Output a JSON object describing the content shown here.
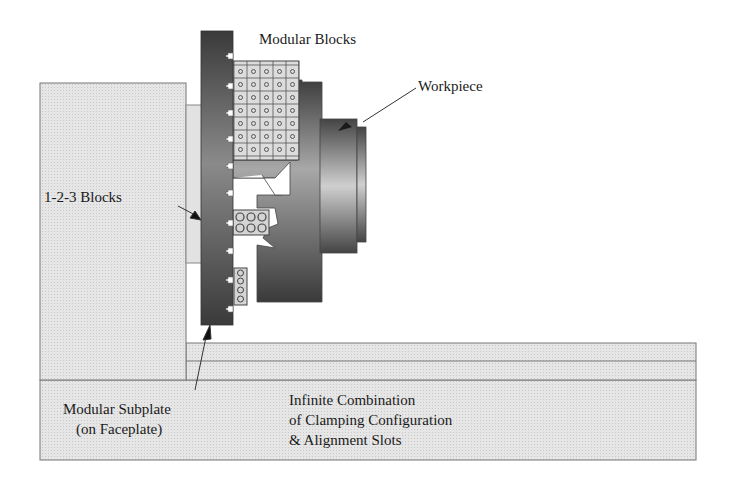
{
  "diagram": {
    "type": "lathe-faceplate-fixturing-illustration",
    "labels": {
      "modular_blocks": "Modular Blocks",
      "workpiece": "Workpiece",
      "blocks_123": "1-2-3 Blocks",
      "subplate_line1": "Modular Subplate",
      "subplate_line2": "(on Faceplate)",
      "combination_line1": "Infinite Combination",
      "combination_line2": "of Clamping Configuration",
      "combination_line3": "& Alignment Slots"
    },
    "components": [
      {
        "id": "base-plate",
        "name": "Base plate / table"
      },
      {
        "id": "angle-plate",
        "name": "Upright angle plate"
      },
      {
        "id": "blocks-123",
        "name": "1-2-3 Blocks"
      },
      {
        "id": "modular-subplate",
        "name": "Modular Subplate (on Faceplate)"
      },
      {
        "id": "modular-blocks",
        "name": "Modular Blocks"
      },
      {
        "id": "workpiece",
        "name": "Workpiece"
      }
    ],
    "colors": {
      "light_fill": "#e4e4e4",
      "mid_fill": "#d6d6d6",
      "dark_fill": "#4a4a4a",
      "outline": "#555555"
    }
  }
}
